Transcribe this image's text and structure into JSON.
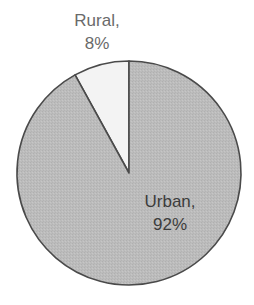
{
  "chart_data": {
    "type": "pie",
    "title": "",
    "categories": [
      "Rural",
      "Urban"
    ],
    "values": [
      8,
      92
    ],
    "unit": "%",
    "labels": [
      "Rural,\n8%",
      "Urban,\n92%"
    ],
    "colors": [
      "#f3f3f3",
      "#bcbcbc"
    ],
    "start_angle_deg": 0,
    "direction": "counterclockwise-from-top for Rural",
    "legend": "none (direct labels)"
  },
  "labels": {
    "rural": {
      "name": "Rural,",
      "value": "8%"
    },
    "urban": {
      "name": "Urban,",
      "value": "92%"
    }
  },
  "style": {
    "outline": "#4a4a4a",
    "rural_fill": "#f3f3f3",
    "urban_fill": "#bcbcbc"
  }
}
